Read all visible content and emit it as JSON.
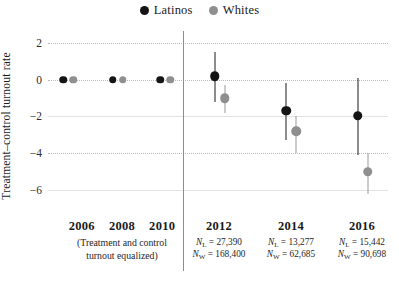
{
  "chart_data": {
    "type": "scatter",
    "title": "",
    "xlabel": "",
    "ylabel": "Treatment–control turnout rate",
    "ylim": [
      -7.2,
      2.6
    ],
    "yticks": [
      2,
      0,
      -2,
      -4,
      -6
    ],
    "ytick_labels": [
      "2",
      "0",
      "−2",
      "−4",
      "−6"
    ],
    "grid": true,
    "legend_position": "top-center",
    "categories": [
      "2006",
      "2008",
      "2010",
      "2012",
      "2014",
      "2016"
    ],
    "series": [
      {
        "name": "Latinos",
        "color": "#141414",
        "values": [
          0,
          0,
          0,
          0.2,
          -1.7,
          -1.95
        ],
        "ci_low": [
          0,
          0,
          0,
          -1.2,
          -3.3,
          -4.1
        ],
        "ci_high": [
          0,
          0,
          0,
          1.5,
          -0.2,
          0.1
        ]
      },
      {
        "name": "Whites",
        "color": "#8f8f8f",
        "values": [
          0,
          0,
          0,
          -1.0,
          -2.8,
          -5.0
        ],
        "ci_low": [
          0,
          0,
          0,
          -1.8,
          -4.0,
          -6.2
        ],
        "ci_high": [
          0,
          0,
          0,
          -0.3,
          -2.0,
          -4.0
        ]
      }
    ],
    "annotations": {
      "equalized_note": "(Treatment and control turnout equalized)",
      "sample_sizes": [
        {
          "year": "2012",
          "n_latino": "27,390",
          "n_white": "168,400"
        },
        {
          "year": "2014",
          "n_latino": "13,277",
          "n_white": "62,685"
        },
        {
          "year": "2016",
          "n_latino": "15,442",
          "n_white": "90,698"
        }
      ]
    }
  },
  "legend": {
    "entries": [
      {
        "label": "Latinos",
        "color": "#141414"
      },
      {
        "label": "Whites",
        "color": "#8f8f8f"
      }
    ]
  },
  "axis": {
    "y_title": "Treatment–control turnout rate",
    "ticks": [
      {
        "label": "2",
        "value": 2
      },
      {
        "label": "0",
        "value": 0
      },
      {
        "label": "−2",
        "value": -2
      },
      {
        "label": "−4",
        "value": -4
      },
      {
        "label": "−6",
        "value": -6
      }
    ]
  },
  "x_axis": {
    "left_group": {
      "years": [
        "2006",
        "2008",
        "2010"
      ],
      "note_line1": "(Treatment and control",
      "note_line2": "turnout equalized)"
    },
    "right_groups": [
      {
        "year": "2012",
        "n_latino_prefix": "N",
        "n_latino_sub": "L",
        "n_latino_value": "=  27,390",
        "n_white_prefix": "N",
        "n_white_sub": "W",
        "n_white_value": "= 168,400"
      },
      {
        "year": "2014",
        "n_latino_prefix": "N",
        "n_latino_sub": "L",
        "n_latino_value": "= 13,277",
        "n_white_prefix": "N",
        "n_white_sub": "W",
        "n_white_value": "= 62,685"
      },
      {
        "year": "2016",
        "n_latino_prefix": "N",
        "n_latino_sub": "L",
        "n_latino_value": "= 15,442",
        "n_white_prefix": "N",
        "n_white_sub": "W",
        "n_white_value": "= 90,698"
      }
    ]
  }
}
